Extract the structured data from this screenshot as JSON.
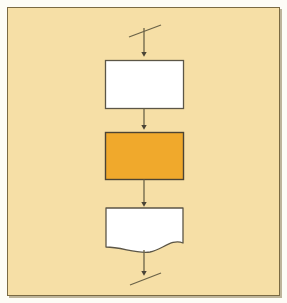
{
  "figure": {
    "kind": "flowchart",
    "orientation": "vertical",
    "panel_background": "#f6dfa6",
    "panel_border_color": "#7a6a43",
    "page_background": "#fdfcf6"
  },
  "nodes": [
    {
      "id": "process-b",
      "shape": "process-rectangle",
      "text": "B=16",
      "step_number": "110",
      "fill": "#ffffff",
      "stroke": "#5c5647"
    },
    {
      "id": "process-c",
      "shape": "process-rectangle",
      "text": "C=SQR(B)",
      "step_number": "120",
      "fill": "#f0a92c",
      "stroke": "#4c4434"
    },
    {
      "id": "output-c",
      "shape": "document",
      "text": "C",
      "step_number": "130",
      "fill": "#ffffff",
      "stroke": "#5c5647"
    }
  ],
  "connectors": [
    {
      "id": "entry-break",
      "type": "break-marker-with-arrow",
      "position": "top"
    },
    {
      "id": "b-to-c",
      "type": "arrow",
      "position": "between-110-and-120"
    },
    {
      "id": "c-to-output",
      "type": "arrow",
      "position": "between-120-and-130"
    },
    {
      "id": "exit-break",
      "type": "arrow-with-break-marker",
      "position": "bottom"
    }
  ],
  "icons": {
    "arrowhead": "arrowhead-down-icon",
    "break": "flow-break-slash-icon"
  }
}
